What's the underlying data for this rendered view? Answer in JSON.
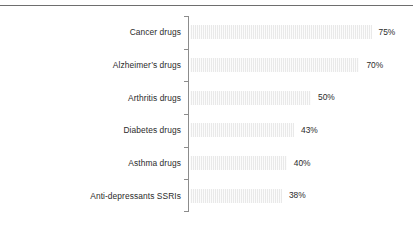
{
  "chart_data": {
    "type": "bar",
    "orientation": "horizontal",
    "title": "",
    "subtitle": "",
    "xlabel": "",
    "ylabel": "",
    "xlim": [
      0,
      80
    ],
    "grid": false,
    "legend": false,
    "value_suffix": "%",
    "categories": [
      "Cancer drugs",
      "Alzheimer’s drugs",
      "Arthritis drugs",
      "Diabetes drugs",
      "Asthma drugs",
      "Anti-depressants SSRIs"
    ],
    "values": [
      75,
      70,
      50,
      43,
      40,
      38
    ],
    "value_labels": [
      "75%",
      "70%",
      "50%",
      "43%",
      "40%",
      "38%"
    ],
    "bars": [
      {
        "label": "Cancer drugs",
        "value": 75,
        "value_label": "75%"
      },
      {
        "label": "Alzheimer’s drugs",
        "value": 70,
        "value_label": "70%"
      },
      {
        "label": "Arthritis drugs",
        "value": 50,
        "value_label": "50%"
      },
      {
        "label": "Diabetes drugs",
        "value": 43,
        "value_label": "43%"
      },
      {
        "label": "Asthma drugs",
        "value": 40,
        "value_label": "40%"
      },
      {
        "label": "Anti-depressants SSRIs",
        "value": 38,
        "value_label": "38%"
      }
    ]
  },
  "style": {
    "bar_fill": "#e9e9e9",
    "axis_color": "#8c8c8c",
    "rule_color": "#6e6e6e",
    "text_color": "#2b2b2b",
    "background": "#ffffff"
  },
  "scale": {
    "px_per_unit": 2.42,
    "bar_origin_px": 190
  }
}
